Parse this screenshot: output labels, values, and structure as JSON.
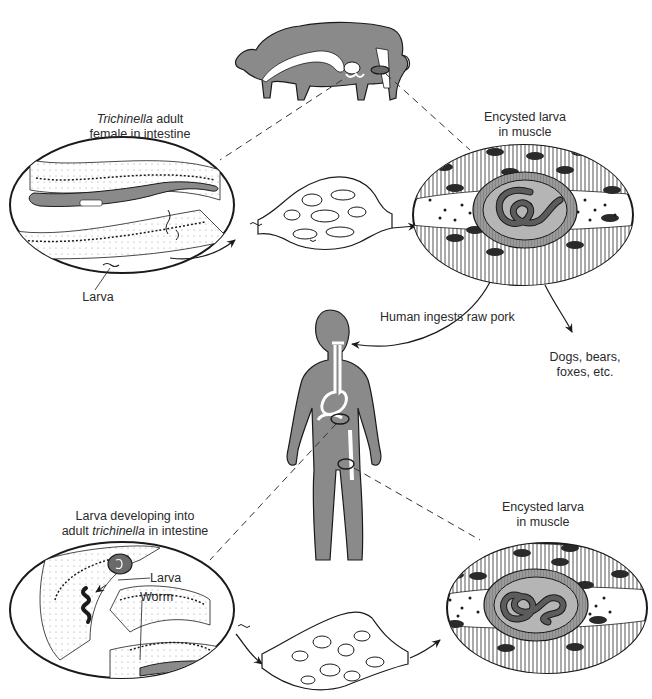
{
  "diagram": {
    "colors": {
      "body_fill": "#8a8a8a",
      "outline": "#1a1a1a",
      "background": "#ffffff",
      "cyst_wall": "#9a9a9a",
      "cyst_interior": "#b5b5b5",
      "worm": "#5c5c5c"
    },
    "labels": {
      "pig_intestine_title_italic": "Trichinella",
      "pig_intestine_title_rest": " adult",
      "pig_intestine_title_line2": "female in intestine",
      "pig_muscle_line1": "Encysted larva",
      "pig_muscle_line2": "in muscle",
      "larva": "Larva",
      "human_ingests": "Human ingests raw pork",
      "other_hosts_line1": "Dogs, bears,",
      "other_hosts_line2": "foxes, etc.",
      "human_intestine_line1": "Larva developing into",
      "human_intestine_line2_pre": "adult ",
      "human_intestine_line2_italic": "trichinella",
      "human_intestine_line2_post": " in intestine",
      "human_intestine_larva": "Larva",
      "human_intestine_worm": "Worm",
      "human_muscle_line1": "Encysted larva",
      "human_muscle_line2": "in muscle"
    },
    "nodes": [
      {
        "id": "pig",
        "icon": "pig-silhouette"
      },
      {
        "id": "pig-intestine",
        "icon": "intestine-oval"
      },
      {
        "id": "pig-lymph",
        "icon": "blood-vessel-network"
      },
      {
        "id": "pig-muscle-cyst",
        "icon": "muscle-cyst-oval"
      },
      {
        "id": "human",
        "icon": "human-silhouette"
      },
      {
        "id": "human-intestine",
        "icon": "intestine-oval"
      },
      {
        "id": "human-lymph",
        "icon": "blood-vessel-network"
      },
      {
        "id": "human-muscle-cyst",
        "icon": "muscle-cyst-oval"
      }
    ],
    "edges": [
      {
        "from": "pig-intestine",
        "to": "pig-lymph",
        "style": "arrow"
      },
      {
        "from": "pig-lymph",
        "to": "pig-muscle-cyst",
        "style": "arrow"
      },
      {
        "from": "pig-muscle-cyst",
        "to": "human",
        "label": "Human ingests raw pork",
        "style": "arrow"
      },
      {
        "from": "pig-muscle-cyst",
        "to": "other-hosts",
        "label": "Dogs, bears, foxes, etc.",
        "style": "arrow"
      },
      {
        "from": "human-intestine",
        "to": "human-lymph",
        "style": "arrow"
      },
      {
        "from": "human-lymph",
        "to": "human-muscle-cyst",
        "style": "arrow"
      },
      {
        "from": "pig",
        "to": "pig-intestine",
        "style": "dashed"
      },
      {
        "from": "pig",
        "to": "pig-muscle-cyst",
        "style": "dashed"
      },
      {
        "from": "human",
        "to": "human-intestine",
        "style": "dashed"
      },
      {
        "from": "human",
        "to": "human-muscle-cyst",
        "style": "dashed"
      }
    ]
  }
}
